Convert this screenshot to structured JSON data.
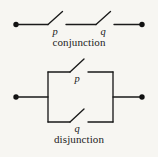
{
  "figure": {
    "background_color": "#f7f6f2",
    "ink_color": "#1a1a1a"
  },
  "conjunction": {
    "caption": "conjunction",
    "type": "series",
    "switches": [
      {
        "label": "p",
        "state": "open"
      },
      {
        "label": "q",
        "state": "open"
      }
    ],
    "terminals": 2
  },
  "disjunction": {
    "caption": "disjunction",
    "type": "parallel",
    "switches": [
      {
        "label": "p",
        "state": "open",
        "branch": "top"
      },
      {
        "label": "q",
        "state": "open",
        "branch": "bottom"
      }
    ],
    "terminals": 2
  }
}
